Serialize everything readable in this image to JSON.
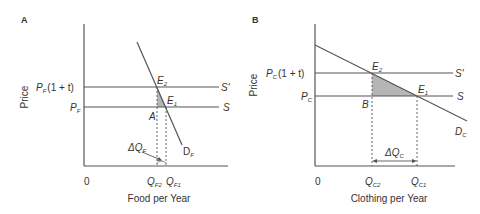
{
  "panels": [
    {
      "id": "A",
      "panel_label": "A",
      "y_axis_label": "Price",
      "x_axis_label": "Food per Year",
      "origin_label": "0",
      "price_high": {
        "base": "P",
        "sub": "F",
        "suffix": "(1 + t)"
      },
      "price_low": {
        "base": "P",
        "sub": "F"
      },
      "supply_taxed_label": "S'",
      "supply_label": "S",
      "demand_label": {
        "base": "D",
        "sub": "F"
      },
      "point_e2": {
        "base": "E",
        "sub": "2"
      },
      "point_e1": {
        "base": "E",
        "sub": "1"
      },
      "point_corner": "A",
      "delta_label": {
        "base": "ΔQ",
        "sub": "F"
      },
      "q2_label": {
        "base": "Q",
        "sub": "F2"
      },
      "q1_label": {
        "base": "Q",
        "sub": "F1"
      }
    },
    {
      "id": "B",
      "panel_label": "B",
      "y_axis_label": "Price",
      "x_axis_label": "Clothing per Year",
      "origin_label": "0",
      "price_high": {
        "base": "P",
        "sub": "C",
        "suffix": "(1 + t)"
      },
      "price_low": {
        "base": "P",
        "sub": "C"
      },
      "supply_taxed_label": "S'",
      "supply_label": "S",
      "demand_label": {
        "base": "D",
        "sub": "C"
      },
      "point_e2": {
        "base": "E",
        "sub": "2"
      },
      "point_e1": {
        "base": "E",
        "sub": "1"
      },
      "point_corner": "B",
      "delta_label": {
        "base": "ΔQ",
        "sub": "C"
      },
      "q2_label": {
        "base": "Q",
        "sub": "C2"
      },
      "q1_label": {
        "base": "Q",
        "sub": "C1"
      }
    }
  ],
  "colors": {
    "line": "#555555",
    "shade": "#b5b5b5",
    "text": "#333333"
  }
}
